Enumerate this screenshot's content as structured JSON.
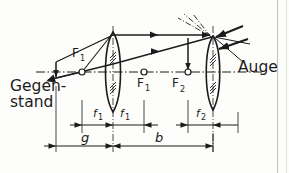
{
  "figure": {
    "kind": "two-lens optical ray diagram",
    "background_color": "#fdfdfb",
    "ink_color": "#1b1b1b",
    "page_border_color": "#c8c8ba"
  },
  "labels": {
    "object_line1": "Gegen-",
    "object_line2": "stand",
    "eye": "Auge",
    "focus_1_left": "F",
    "focus_1_left_sub": "1",
    "focus_1_right": "F",
    "focus_1_right_sub": "1",
    "focus_2": "F",
    "focus_2_sub": "2",
    "focal_len_1a": "f",
    "focal_len_1a_sub": "1",
    "focal_len_1b": "f",
    "focal_len_1b_sub": "1",
    "focal_len_2": "f",
    "focal_len_2_sub": "2",
    "object_distance": "g",
    "image_distance": "b"
  },
  "optics": {
    "axis_y": 72,
    "lens1_x": 113,
    "lens2_x": 213,
    "object_x": 56,
    "focus1_left_x": 82,
    "focus1_right_x": 144,
    "focus2_x": 188,
    "intermediate_image_x": 188,
    "focal_length_1": 31,
    "focal_length_2": 25,
    "g_label_span": "56 to 113",
    "b_label_span": "113 to 213"
  },
  "icon_names": {
    "lens": "converging-lens-icon",
    "ray_arrow": "ray-arrowhead-icon",
    "focal_point": "focal-point-marker-icon",
    "dimension_arrow": "dimension-arrow-icon",
    "eye_rays": "eye-ray-bundle-icon",
    "axis": "optical-axis-icon"
  }
}
